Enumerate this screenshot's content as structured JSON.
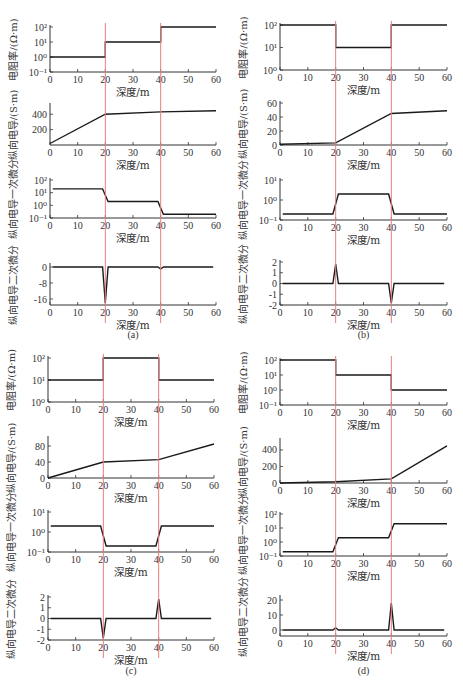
{
  "figure": {
    "x_label": "深度/m",
    "x_ticks": [
      "0",
      "10",
      "20",
      "30",
      "40",
      "50",
      "60"
    ],
    "y_labels": {
      "resistivity": "电阻率/(Ω·m)",
      "conductance": "纵向电导/(S·m)",
      "first_derivative": "纵向电导一次微分",
      "second_derivative": "纵向电导二次微分"
    },
    "boundary_color": "#e8807a",
    "line_color": "#1a1a1a",
    "captions": [
      "(a)",
      "(b)",
      "(c)",
      "(d)"
    ],
    "bottom_caption": ""
  },
  "chart_data": [
    {
      "panel": "(a)",
      "type": "line",
      "boundaries": [
        20,
        40
      ],
      "subplots": [
        {
          "ylabel": "电阻率/(Ω·m)",
          "yscale": "log",
          "yticks": [
            "10⁻¹",
            "10⁰",
            "10¹",
            "10²"
          ],
          "ylim": [
            0.1,
            100
          ],
          "x": [
            0,
            20,
            20,
            40,
            40,
            60
          ],
          "y": [
            1,
            1,
            10,
            10,
            100,
            100
          ]
        },
        {
          "ylabel": "纵向电导/(S·m)",
          "yscale": "linear",
          "yticks": [
            "200",
            "400"
          ],
          "ylim": [
            0,
            520
          ],
          "x": [
            0,
            20,
            40,
            60
          ],
          "y": [
            20,
            400,
            430,
            445
          ]
        },
        {
          "ylabel": "纵向电导一次微分",
          "yscale": "log",
          "yticks": [
            "10⁻¹",
            "10⁰",
            "10¹",
            "10²"
          ],
          "ylim": [
            0.1,
            100
          ],
          "x": [
            1,
            19,
            21,
            39,
            41,
            60
          ],
          "y": [
            20,
            20,
            2,
            2,
            0.2,
            0.2
          ]
        },
        {
          "ylabel": "纵向电导二次微分",
          "yscale": "linear",
          "yticks": [
            "0",
            "-8",
            "-16"
          ],
          "ylim": [
            -19,
            1
          ],
          "x": [
            1,
            19,
            20,
            21,
            39,
            40,
            41,
            59
          ],
          "y": [
            0,
            0,
            -18,
            0,
            0,
            -1,
            0,
            0
          ]
        }
      ]
    },
    {
      "panel": "(b)",
      "type": "line",
      "boundaries": [
        20,
        40
      ],
      "subplots": [
        {
          "ylabel": "电阻率/(Ω·m)",
          "yscale": "log",
          "yticks": [
            "10⁰",
            "10¹",
            "10²"
          ],
          "ylim": [
            1,
            100
          ],
          "x": [
            0,
            20,
            20,
            40,
            40,
            60
          ],
          "y": [
            100,
            100,
            10,
            10,
            100,
            100
          ]
        },
        {
          "ylabel": "纵向电导/(S·m)",
          "yscale": "linear",
          "yticks": [
            "0",
            "20",
            "40",
            "60"
          ],
          "ylim": [
            0,
            60
          ],
          "x": [
            0,
            20,
            40,
            60
          ],
          "y": [
            1,
            3,
            45,
            49
          ]
        },
        {
          "ylabel": "纵向电导一次微分",
          "yscale": "log",
          "yticks": [
            "10⁻¹",
            "10⁰",
            "10¹"
          ],
          "ylim": [
            0.1,
            10
          ],
          "x": [
            1,
            19,
            21,
            39,
            41,
            60
          ],
          "y": [
            0.2,
            0.2,
            2,
            2,
            0.2,
            0.2
          ]
        },
        {
          "ylabel": "纵向电导二次微分",
          "yscale": "linear",
          "yticks": [
            "2",
            "1",
            "0",
            "-1",
            "-2"
          ],
          "ylim": [
            -2,
            2
          ],
          "x": [
            1,
            19,
            20,
            21,
            39,
            40,
            41,
            59
          ],
          "y": [
            0,
            0,
            1.8,
            0,
            0,
            -1.8,
            0,
            0
          ]
        }
      ]
    },
    {
      "panel": "(c)",
      "type": "line",
      "boundaries": [
        20,
        40
      ],
      "subplots": [
        {
          "ylabel": "电阻率/(Ω·m)",
          "yscale": "log",
          "yticks": [
            "10⁰",
            "10¹",
            "10²"
          ],
          "ylim": [
            1,
            100
          ],
          "x": [
            0,
            20,
            20,
            40,
            40,
            60
          ],
          "y": [
            10,
            10,
            100,
            100,
            10,
            10
          ]
        },
        {
          "ylabel": "纵向电导/(S·m)",
          "yscale": "linear",
          "yticks": [
            "0",
            "40",
            "80"
          ],
          "ylim": [
            0,
            100
          ],
          "x": [
            0,
            20,
            40,
            60
          ],
          "y": [
            0,
            40,
            46,
            85
          ]
        },
        {
          "ylabel": "纵向电导一次微分",
          "yscale": "log",
          "yticks": [
            "10⁻¹",
            "10⁰",
            "10¹"
          ],
          "ylim": [
            0.1,
            10
          ],
          "x": [
            1,
            19,
            21,
            39,
            41,
            60
          ],
          "y": [
            2,
            2,
            0.2,
            0.2,
            2,
            2
          ]
        },
        {
          "ylabel": "纵向电导二次微分",
          "yscale": "linear",
          "yticks": [
            "2",
            "1",
            "0",
            "-1",
            "-2"
          ],
          "ylim": [
            -2,
            2
          ],
          "x": [
            1,
            19,
            20,
            21,
            39,
            40,
            41,
            59
          ],
          "y": [
            0,
            0,
            -1.8,
            0,
            0,
            1.8,
            0,
            0
          ]
        }
      ]
    },
    {
      "panel": "(d)",
      "type": "line",
      "boundaries": [
        20,
        40
      ],
      "subplots": [
        {
          "ylabel": "电阻率/(Ω·m)",
          "yscale": "log",
          "yticks": [
            "10⁻¹",
            "10⁰",
            "10¹",
            "10²"
          ],
          "ylim": [
            0.1,
            100
          ],
          "x": [
            0,
            20,
            20,
            40,
            40,
            60
          ],
          "y": [
            100,
            100,
            10,
            10,
            1,
            1
          ]
        },
        {
          "ylabel": "纵向电导/(S·m)",
          "yscale": "linear",
          "yticks": [
            "0",
            "200",
            "400"
          ],
          "ylim": [
            0,
            520
          ],
          "x": [
            0,
            20,
            40,
            60
          ],
          "y": [
            0,
            15,
            50,
            450
          ]
        },
        {
          "ylabel": "纵向电导一次微分",
          "yscale": "log",
          "yticks": [
            "10⁻¹",
            "10⁰",
            "10¹",
            "10²"
          ],
          "ylim": [
            0.1,
            100
          ],
          "x": [
            1,
            19,
            21,
            39,
            41,
            60
          ],
          "y": [
            0.2,
            0.2,
            2,
            2,
            20,
            20
          ]
        },
        {
          "ylabel": "纵向电导二次微分",
          "yscale": "linear",
          "yticks": [
            "0",
            "10",
            "20"
          ],
          "ylim": [
            -4,
            22
          ],
          "x": [
            1,
            19,
            20,
            21,
            39,
            40,
            41,
            59
          ],
          "y": [
            0,
            0,
            1.5,
            0,
            0,
            18,
            0,
            0
          ]
        }
      ]
    }
  ]
}
